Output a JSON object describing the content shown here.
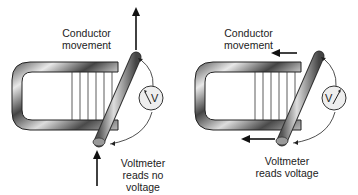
{
  "left_panel": {
    "movement_label_line1": "Conductor",
    "movement_label_line2": "movement",
    "meter_symbol": "V",
    "meter_label_line1": "Voltmeter",
    "meter_label_line2": "reads no",
    "meter_label_line3": "voltage",
    "movement_direction": "up (parallel to flux)"
  },
  "right_panel": {
    "movement_label_line1": "Conductor",
    "movement_label_line2": "movement",
    "meter_symbol": "V",
    "meter_label_line1": "Voltmeter",
    "meter_label_line2": "reads voltage",
    "movement_direction": "left (across flux)"
  },
  "colors": {
    "magnet_light": "#e8e8e8",
    "magnet_dark": "#3a3a3a",
    "line": "#111111",
    "background": "#ffffff"
  }
}
